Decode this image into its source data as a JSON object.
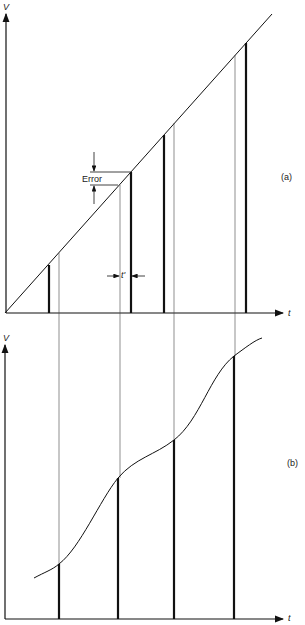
{
  "figure": {
    "panel_a": {
      "label": "(a)",
      "y_axis_label": "V",
      "x_axis_label": "t",
      "error_label": "Error",
      "delay_label": "t'",
      "ramp": {
        "x1": 5,
        "y1": 313,
        "x2": 272,
        "y2": 14
      },
      "samples": [
        {
          "bar_x": 49,
          "ref_x": 59
        },
        {
          "bar_x": 131,
          "ref_x": 120
        },
        {
          "bar_x": 164,
          "ref_x": 174
        },
        {
          "bar_x": 246,
          "ref_x": 235
        }
      ]
    },
    "panel_b": {
      "label": "(b)",
      "y_axis_label": "V",
      "x_axis_label": "t",
      "samples": [
        {
          "x": 59,
          "top": 564
        },
        {
          "x": 118,
          "top": 478
        },
        {
          "x": 174,
          "top": 440
        },
        {
          "x": 234,
          "top": 356
        }
      ]
    }
  }
}
